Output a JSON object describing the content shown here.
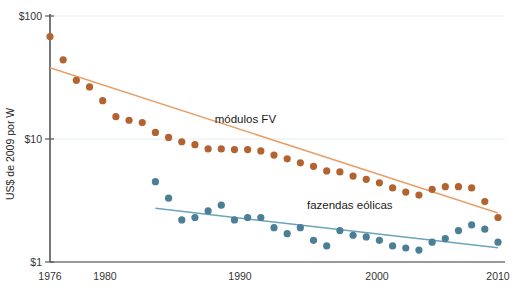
{
  "chart_data": {
    "type": "scatter",
    "title": "",
    "xlabel": "",
    "ylabel": "US$ de 2009 por W",
    "yscale": "log",
    "ylim": [
      1,
      100
    ],
    "xlim": [
      1976,
      2010
    ],
    "ytick_labels": [
      "$100",
      "$10",
      "$1"
    ],
    "ytick_values": [
      100,
      10,
      1
    ],
    "xtick_labels": [
      "1976",
      "1980",
      "1990",
      "2000",
      "2010"
    ],
    "xtick_values": [
      1976,
      1980,
      1990,
      2000,
      2010
    ],
    "grid": "horizontal",
    "legend_position": "inline-annotations",
    "colors": {
      "pv_modules": "#b3632f",
      "pv_trend": "#e8a06a",
      "wind_farms": "#4a7f96",
      "wind_trend": "#6ba3bd",
      "axis": "#555555",
      "gridline": "#e3eef0",
      "background": "#ffffff"
    },
    "series": [
      {
        "name": "módulos FV",
        "label": "módulos FV",
        "color": "#b3632f",
        "marker": "circle",
        "x": [
          1976,
          1977,
          1978,
          1979,
          1980,
          1981,
          1982,
          1983,
          1984,
          1985,
          1986,
          1987,
          1988,
          1989,
          1990,
          1991,
          1992,
          1993,
          1994,
          1995,
          1996,
          1997,
          1998,
          1999,
          2000,
          2001,
          2002,
          2003,
          2004,
          2005,
          2006,
          2007,
          2008,
          2009,
          2010
        ],
        "values": [
          68.0,
          44.0,
          30.0,
          26.5,
          20.5,
          15.2,
          14.2,
          13.6,
          11.3,
          10.3,
          9.5,
          9.0,
          8.3,
          8.3,
          8.2,
          8.2,
          8.0,
          7.4,
          6.9,
          6.4,
          6.0,
          5.5,
          5.4,
          5.0,
          4.7,
          4.4,
          4.0,
          3.7,
          3.5,
          3.9,
          4.1,
          4.1,
          4.0,
          3.1,
          2.3
        ],
        "trend": {
          "x": [
            1976,
            2010
          ],
          "y": [
            38.0,
            2.5
          ]
        }
      },
      {
        "name": "fazendas eólicas",
        "label": "fazendas eólicas",
        "color": "#4a7f96",
        "marker": "circle",
        "x": [
          1984,
          1985,
          1986,
          1987,
          1988,
          1989,
          1990,
          1991,
          1992,
          1993,
          1994,
          1995,
          1996,
          1997,
          1998,
          1999,
          2000,
          2001,
          2002,
          2003,
          2004,
          2005,
          2006,
          2007,
          2008,
          2009,
          2010
        ],
        "values": [
          4.5,
          3.3,
          2.2,
          2.3,
          2.6,
          2.9,
          2.2,
          2.3,
          2.3,
          1.9,
          1.7,
          1.9,
          1.5,
          1.35,
          1.8,
          1.65,
          1.6,
          1.5,
          1.35,
          1.3,
          1.25,
          1.45,
          1.55,
          1.8,
          2.0,
          1.85,
          1.45
        ]
      }
    ],
    "annotations": [
      {
        "text": "módulos FV",
        "x": 1988.5,
        "y": 13.5
      },
      {
        "text": "fazendas eólicas",
        "x": 1995.5,
        "y": 2.7
      }
    ]
  },
  "axes": {
    "y_title": "US$ de 2009 por W",
    "y_ticks": [
      "$100",
      "$10",
      "$1"
    ],
    "x_ticks": [
      "1976",
      "1980",
      "1990",
      "2000",
      "2010"
    ]
  },
  "labels": {
    "pv": "módulos FV",
    "wind": "fazendas eólicas"
  }
}
